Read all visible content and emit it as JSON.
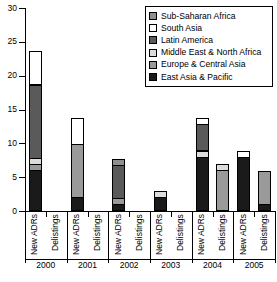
{
  "chart_data": {
    "type": "bar",
    "subtype": "stacked-bar",
    "title": "",
    "xlabel": "",
    "ylabel": "",
    "ylim": [
      0,
      30
    ],
    "ytick_values": [
      0,
      5,
      10,
      15,
      20,
      25,
      30
    ],
    "ytick_labels": [
      "0",
      "5",
      "10",
      "15",
      "20",
      "25",
      "30"
    ],
    "grid": false,
    "legend_position": "top-right",
    "categories": [
      "2000 New ADRs",
      "2000 Delistings",
      "2001 New ADRs",
      "2001 Delistings",
      "2002 New ADRs",
      "2002 Delistings",
      "2003 New ADRs",
      "2003 Delistings",
      "2004 New ADRs",
      "2004 Delistings",
      "2005 New ADRs",
      "2005 Delistings"
    ],
    "groups": [
      "2000",
      "2001",
      "2002",
      "2003",
      "2004",
      "2005"
    ],
    "subcategories": [
      "New ADRs",
      "Delistings"
    ],
    "series": [
      {
        "name": "East Asia & Pacific",
        "color": "#1a1a1a",
        "values": [
          6,
          0,
          2,
          0,
          1,
          0,
          2,
          0,
          8,
          0,
          8,
          1
        ]
      },
      {
        "name": "Europe & Central Asia",
        "color": "#9a9a9a",
        "values": [
          1,
          0,
          8,
          0,
          1,
          0,
          0,
          0,
          0,
          6,
          0,
          5
        ]
      },
      {
        "name": "Middle East & North Africa",
        "color": "#dcdcdc",
        "values": [
          1,
          0,
          0,
          0,
          0,
          0,
          1,
          0,
          1,
          1,
          0,
          0
        ]
      },
      {
        "name": "Latin America",
        "color": "#5a5a5a",
        "values": [
          11,
          0,
          0,
          0,
          5,
          0,
          0,
          0,
          4,
          0,
          0,
          0
        ]
      },
      {
        "name": "South Asia",
        "color": "#ffffff",
        "values": [
          5,
          0,
          4,
          0,
          0,
          0,
          0,
          0,
          1,
          0,
          1,
          0
        ]
      },
      {
        "name": "Sub-Saharan Africa",
        "color": "#8f8f8f",
        "values": [
          0,
          0,
          0,
          0,
          1,
          0,
          0,
          0,
          0,
          0,
          0,
          0
        ]
      }
    ],
    "totals": [
      24,
      0,
      14,
      0,
      8,
      0,
      3,
      0,
      14,
      7,
      9,
      6
    ]
  },
  "legend": {
    "items": [
      {
        "label": "Sub-Saharan Africa",
        "color": "#8f8f8f"
      },
      {
        "label": "South Asia",
        "color": "#ffffff"
      },
      {
        "label": "Latin America",
        "color": "#5a5a5a"
      },
      {
        "label": "Middle East & North Africa",
        "color": "#dcdcdc"
      },
      {
        "label": "Europe & Central Asia",
        "color": "#9a9a9a"
      },
      {
        "label": "East Asia & Pacific",
        "color": "#1a1a1a"
      }
    ]
  },
  "axis": {
    "y_labels": [
      "30",
      "25",
      "20",
      "15",
      "10",
      "5",
      "0"
    ],
    "x_group_labels": [
      "2000",
      "2001",
      "2002",
      "2003",
      "2004",
      "2005"
    ],
    "x_item_labels": [
      "New ADRs",
      "Delistings",
      "New ADRs",
      "Delistings",
      "New ADRs",
      "Delistings",
      "New ADRs",
      "Delistings",
      "New ADRs",
      "Delistings",
      "New ADRs",
      "Delistings"
    ]
  }
}
